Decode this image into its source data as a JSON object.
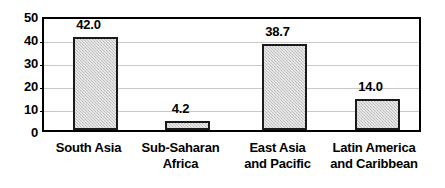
{
  "chart_data": {
    "type": "bar",
    "title": "",
    "subtitle": "",
    "xlabel": "",
    "ylabel": "",
    "ylim": [
      0,
      50
    ],
    "yticks": [
      "0",
      "10",
      "20",
      "30",
      "40",
      "50"
    ],
    "grid": true,
    "legend": "none",
    "categories": [
      "South Asia",
      "Sub-Saharan Africa",
      "East Asia and Pacific",
      "Latin America and Caribbean"
    ],
    "category_lines": [
      [
        "South Asia",
        ""
      ],
      [
        "Sub-Saharan",
        "Africa"
      ],
      [
        "East Asia",
        "and Pacific"
      ],
      [
        "Latin America",
        "and Caribbean"
      ]
    ],
    "values": [
      42.0,
      4.2,
      38.7,
      14.0
    ],
    "value_labels": [
      "42.0",
      "4.2",
      "38.7",
      "14.0"
    ],
    "colors": {
      "bar_fill": "#cccccc",
      "bar_border": "#1a1a1a",
      "gridline": "#c9c9c9",
      "axis": "#000000",
      "text": "#000000",
      "background": "#ffffff"
    }
  }
}
